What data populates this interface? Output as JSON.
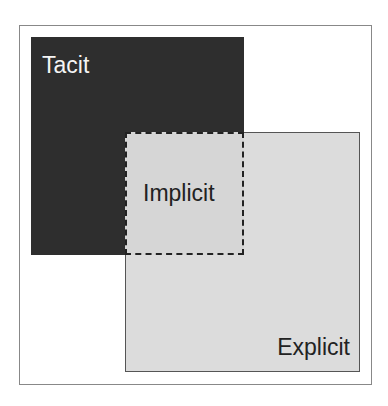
{
  "diagram": {
    "type": "overlapping-squares",
    "regions": [
      {
        "name": "tacit",
        "label": "Tacit",
        "color": "#2e2e2e"
      },
      {
        "name": "explicit",
        "label": "Explicit",
        "color": "#dcdcdc"
      },
      {
        "name": "implicit",
        "label": "Implicit",
        "style": "dashed-overlap"
      }
    ]
  }
}
